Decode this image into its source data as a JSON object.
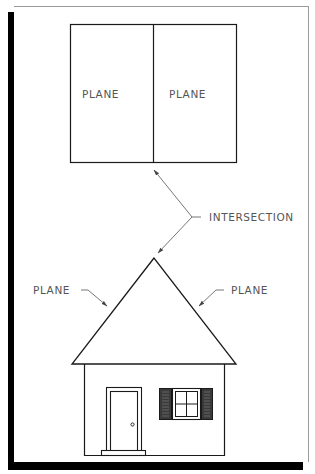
{
  "diagram": {
    "top_figure": {
      "left_plane_label": "PLANE",
      "right_plane_label": "PLANE"
    },
    "callout": {
      "label": "INTERSECTION"
    },
    "house_figure": {
      "left_roof_label": "PLANE",
      "right_roof_label": "PLANE",
      "elements": [
        "roof",
        "walls",
        "door",
        "door-knob",
        "door-step",
        "window",
        "shutters"
      ]
    },
    "colors": {
      "line": "#1a1a1a",
      "leader": "#666666",
      "text": "#555555",
      "shadow": "#000000",
      "frame": "#9a9a9a"
    }
  }
}
